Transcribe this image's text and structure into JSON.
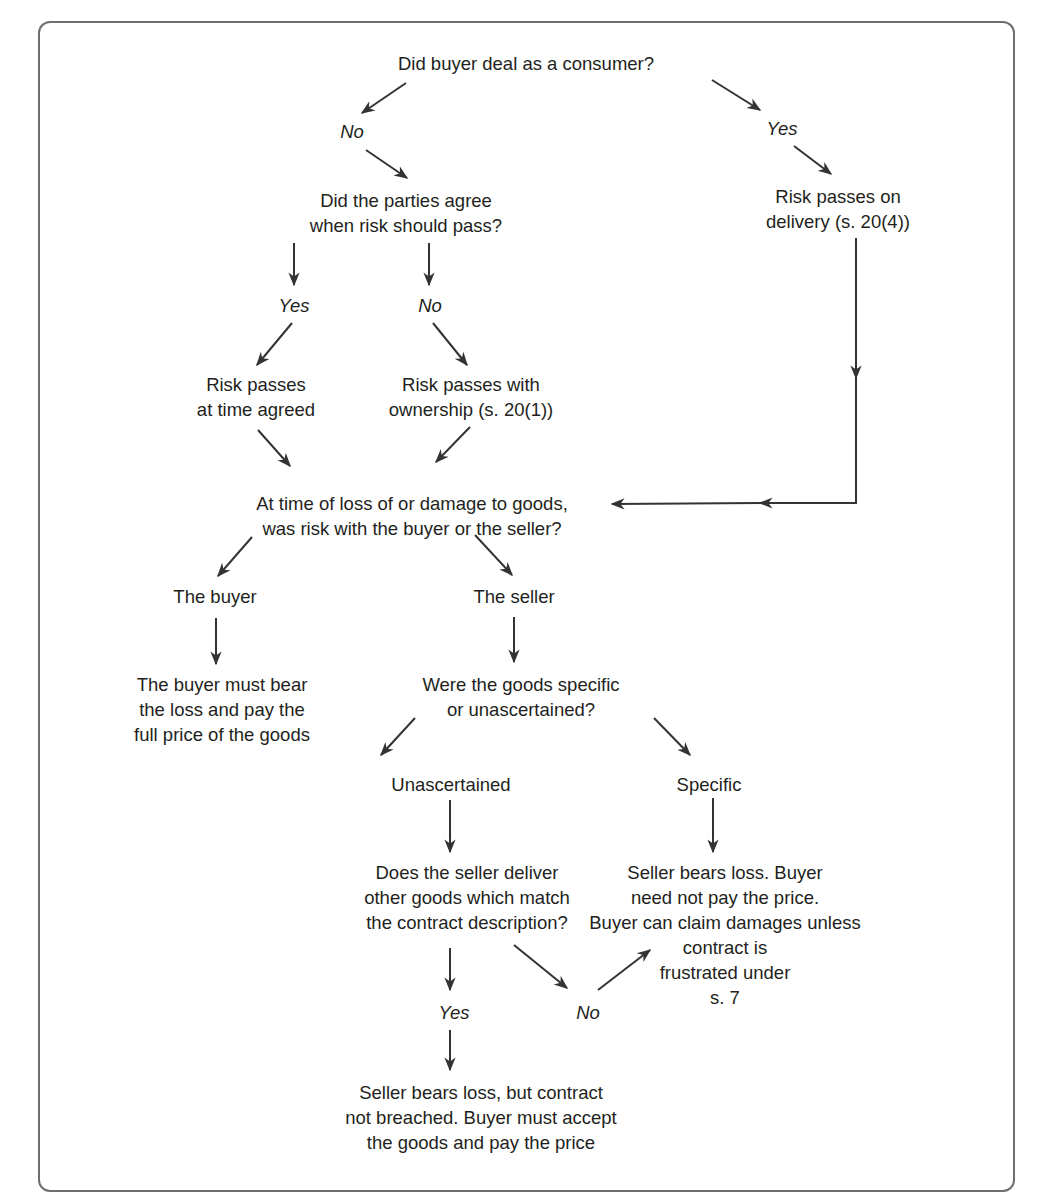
{
  "diagram": {
    "type": "flowchart",
    "nodes": {
      "q_consumer": "Did buyer deal as a consumer?",
      "lbl_no_1": "No",
      "lbl_yes_1": "Yes",
      "q_agree": "Did the parties agree\nwhen risk should pass?",
      "r_delivery": "Risk passes on\ndelivery (s. 20(4))",
      "lbl_yes_2": "Yes",
      "lbl_no_2": "No",
      "r_time_agreed": "Risk passes\nat time agreed",
      "r_ownership": "Risk passes with\nownership (s. 20(1))",
      "q_risk_with": "At time of loss of or damage to goods,\nwas risk with the buyer or the seller?",
      "a_buyer": "The buyer",
      "a_seller": "The seller",
      "r_buyer_bears": "The buyer must bear\nthe loss and pay the\nfull price of the goods",
      "q_goods_type": "Were the goods specific\nor unascertained?",
      "a_unascertained": "Unascertained",
      "a_specific": "Specific",
      "q_deliver_other": "Does the seller deliver\nother goods which match\nthe contract description?",
      "r_specific": "Seller bears loss. Buyer\nneed not pay the price.\nBuyer can claim damages unless\ncontract is\nfrustrated under\ns. 7",
      "lbl_yes_3": "Yes",
      "lbl_no_3": "No",
      "r_not_breached": "Seller bears loss, but contract\nnot breached. Buyer must accept\nthe goods and pay the price"
    },
    "edges": [
      {
        "from": "q_consumer",
        "to": "lbl_no_1"
      },
      {
        "from": "q_consumer",
        "to": "lbl_yes_1"
      },
      {
        "from": "lbl_no_1",
        "to": "q_agree"
      },
      {
        "from": "lbl_yes_1",
        "to": "r_delivery"
      },
      {
        "from": "q_agree",
        "to": "lbl_yes_2"
      },
      {
        "from": "q_agree",
        "to": "lbl_no_2"
      },
      {
        "from": "lbl_yes_2",
        "to": "r_time_agreed"
      },
      {
        "from": "lbl_no_2",
        "to": "r_ownership"
      },
      {
        "from": "r_time_agreed",
        "to": "q_risk_with"
      },
      {
        "from": "r_ownership",
        "to": "q_risk_with"
      },
      {
        "from": "r_delivery",
        "to": "q_risk_with"
      },
      {
        "from": "q_risk_with",
        "to": "a_buyer"
      },
      {
        "from": "q_risk_with",
        "to": "a_seller"
      },
      {
        "from": "a_buyer",
        "to": "r_buyer_bears"
      },
      {
        "from": "a_seller",
        "to": "q_goods_type"
      },
      {
        "from": "q_goods_type",
        "to": "a_unascertained"
      },
      {
        "from": "q_goods_type",
        "to": "a_specific"
      },
      {
        "from": "a_unascertained",
        "to": "q_deliver_other"
      },
      {
        "from": "a_specific",
        "to": "r_specific"
      },
      {
        "from": "q_deliver_other",
        "to": "lbl_yes_3"
      },
      {
        "from": "q_deliver_other",
        "to": "lbl_no_3"
      },
      {
        "from": "lbl_no_3",
        "to": "r_specific"
      },
      {
        "from": "lbl_yes_3",
        "to": "r_not_breached"
      }
    ],
    "colors": {
      "frame": "#6e6e6e",
      "text": "#231f20",
      "arrow": "#333333"
    }
  }
}
